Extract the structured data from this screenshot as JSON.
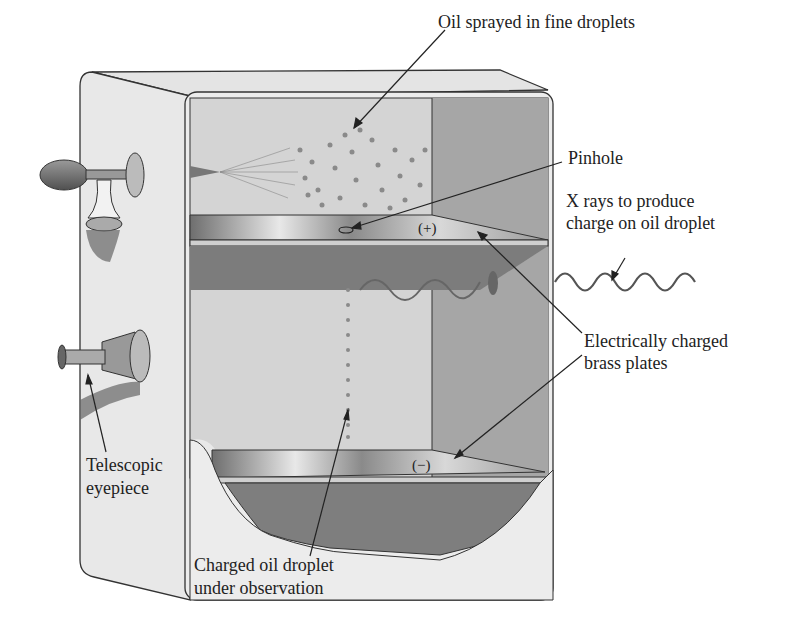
{
  "diagram": {
    "labels": {
      "oil_spray": "Oil sprayed in fine droplets",
      "pinhole": "Pinhole",
      "xrays_line1": "X rays to produce",
      "xrays_line2": "charge on oil droplet",
      "plates_line1": "Electrically charged",
      "plates_line2": "brass plates",
      "eyepiece_line1": "Telescopic",
      "eyepiece_line2": "eyepiece",
      "droplet_line1": "Charged oil droplet",
      "droplet_line2": "under observation"
    },
    "plate_signs": {
      "top": "(+)",
      "bottom": "(−)"
    },
    "components": [
      "atomizer-bulb",
      "oil-reservoir",
      "spray-nozzle",
      "top-plate",
      "bottom-plate",
      "pinhole",
      "x-ray-source",
      "telescopic-eyepiece",
      "chamber-box"
    ],
    "colors": {
      "box_face": "#e6e6e6",
      "interior": "#d2d2d2",
      "interior_dark": "#8c8c8c",
      "plate": "#bdbdbd",
      "line": "#333333"
    }
  }
}
